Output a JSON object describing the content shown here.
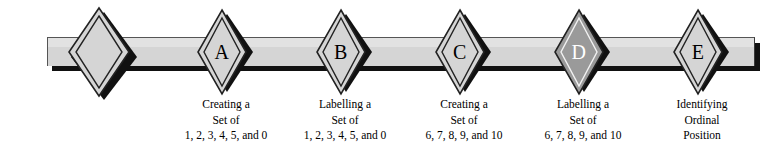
{
  "figure": {
    "type": "process-flow-banner",
    "title": "",
    "bar": {
      "fill_color": "#d5d5d5",
      "highlight_color": "#e2e2e2",
      "shadow_color": "#111111",
      "outline_color": "#555555"
    },
    "nodes": [
      {
        "id": "start",
        "letter": "",
        "fill": "#d5d5d5",
        "letter_color": "#000000",
        "center_x": 103,
        "center_y": 52,
        "half_width": 30,
        "half_height": 44,
        "caption": []
      },
      {
        "id": "a",
        "letter": "A",
        "fill": "#d5d5d5",
        "letter_color": "#000000",
        "center_x": 226,
        "center_y": 52,
        "half_width": 25,
        "half_height": 40,
        "caption": [
          "Creating a",
          "Set of",
          "1, 2, 3, 4, 5, and 0"
        ]
      },
      {
        "id": "b",
        "letter": "B",
        "fill": "#d5d5d5",
        "letter_color": "#000000",
        "center_x": 345,
        "center_y": 52,
        "half_width": 25,
        "half_height": 40,
        "caption": [
          "Labelling a",
          "Set of",
          "1, 2, 3, 4, 5, and 0"
        ]
      },
      {
        "id": "c",
        "letter": "C",
        "fill": "#d5d5d5",
        "letter_color": "#000000",
        "center_x": 464,
        "center_y": 52,
        "half_width": 25,
        "half_height": 40,
        "caption": [
          "Creating a",
          "Set of",
          "6, 7, 8, 9, and 10"
        ]
      },
      {
        "id": "d",
        "letter": "D",
        "fill": "#9a9a9a",
        "letter_color": "#ffffff",
        "center_x": 583,
        "center_y": 52,
        "half_width": 25,
        "half_height": 40,
        "caption": [
          "Labelling a",
          "Set of",
          "6, 7, 8, 9, and 10"
        ]
      },
      {
        "id": "e",
        "letter": "E",
        "fill": "#d5d5d5",
        "letter_color": "#000000",
        "center_x": 702,
        "center_y": 52,
        "half_width": 25,
        "half_height": 40,
        "caption": [
          "Identifying",
          "Ordinal",
          "Position"
        ]
      }
    ]
  }
}
